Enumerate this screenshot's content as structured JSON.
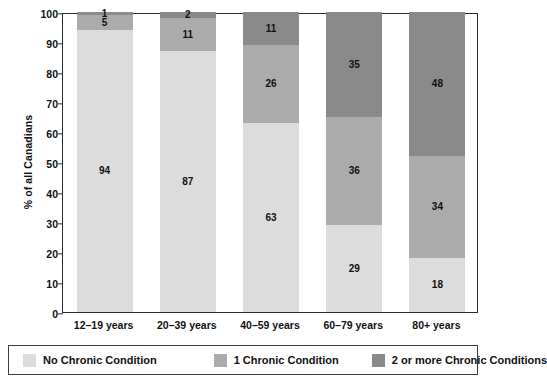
{
  "chart_data": {
    "type": "bar",
    "subtype": "stacked-bar-100",
    "title": "",
    "xlabel": "",
    "ylabel": "% of all Canadians",
    "ylim": [
      0,
      100
    ],
    "ytick_step": 10,
    "yticks": [
      100,
      90,
      80,
      70,
      60,
      50,
      40,
      30,
      20,
      10,
      0
    ],
    "grid": false,
    "legend_position": "bottom",
    "categories": [
      "12–19 years",
      "20–39 years",
      "40–59 years",
      "60–79 years",
      "80+ years"
    ],
    "series": [
      {
        "name": "No Chronic Condition",
        "color": "#dcdcdc",
        "values": [
          94,
          87,
          63,
          29,
          18
        ]
      },
      {
        "name": "1 Chronic Condition",
        "color": "#ababab",
        "values": [
          5,
          11,
          26,
          36,
          34
        ]
      },
      {
        "name": "2 or more Chronic Conditions",
        "color": "#8a8a8a",
        "values": [
          1,
          2,
          11,
          35,
          48
        ]
      }
    ]
  },
  "axis": {
    "y_title": "% of all Canadians"
  },
  "legend": {
    "items": [
      {
        "label": "No Chronic Condition",
        "color": "#dcdcdc"
      },
      {
        "label": "1 Chronic Condition",
        "color": "#ababab"
      },
      {
        "label": "2 or more Chronic Conditions",
        "color": "#8a8a8a"
      }
    ]
  },
  "colors": {
    "series_light": "#dcdcdc",
    "series_medium": "#ababab",
    "series_dark": "#8a8a8a",
    "axis": "#2b2b2b",
    "text": "#111111",
    "background": "#ffffff"
  }
}
